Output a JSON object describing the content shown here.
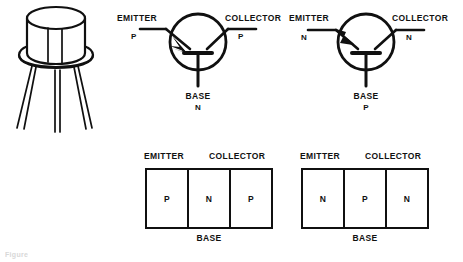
{
  "figure": {
    "background_color": "#ffffff",
    "line_color": "#101010",
    "caption_fragment": "Figure",
    "package": {
      "name": "transistor-can-package",
      "type": "TO-5 metal can",
      "lead_count": 3
    },
    "symbols": [
      {
        "id": "pnp-symbol",
        "type": "PNP",
        "arrow_direction": "inward",
        "emitter_label": "EMITTER",
        "emitter_type": "P",
        "collector_label": "COLLECTOR",
        "collector_type": "P",
        "base_label": "BASE",
        "base_type": "N"
      },
      {
        "id": "npn-symbol",
        "type": "NPN",
        "arrow_direction": "outward",
        "emitter_label": "EMITTER",
        "emitter_type": "N",
        "collector_label": "COLLECTOR",
        "collector_type": "N",
        "base_label": "BASE",
        "base_type": "P"
      }
    ],
    "blocks": [
      {
        "id": "pnp-block",
        "type": "PNP",
        "emitter_label": "EMITTER",
        "collector_label": "COLLECTOR",
        "base_label": "BASE",
        "layers": [
          "P",
          "N",
          "P"
        ]
      },
      {
        "id": "npn-block",
        "type": "NPN",
        "emitter_label": "EMITTER",
        "collector_label": "COLLECTOR",
        "base_label": "BASE",
        "layers": [
          "N",
          "P",
          "N"
        ]
      }
    ]
  }
}
